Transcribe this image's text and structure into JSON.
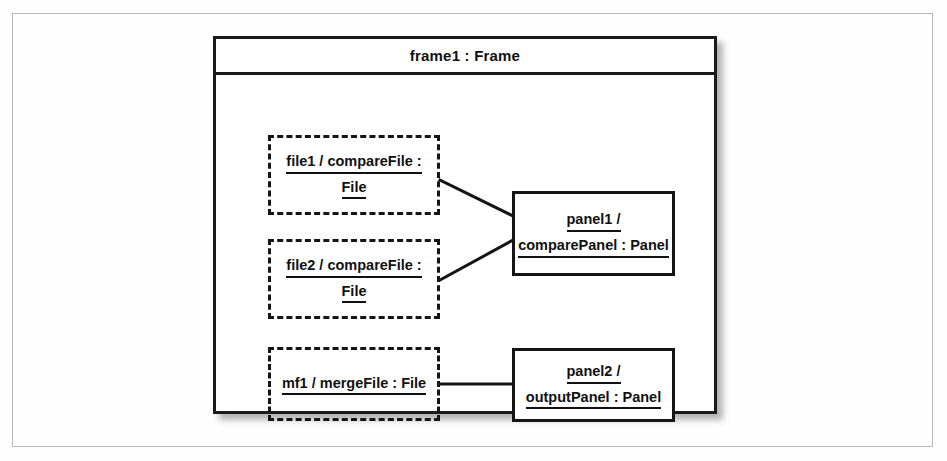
{
  "diagram": {
    "type": "uml-composite-structure",
    "frame": {
      "title": "frame1 : Frame",
      "title_underlined": false
    },
    "parts": [
      {
        "id": "file1",
        "kind": "dashed-part-box",
        "lines": [
          "file1 / compareFile :",
          "File"
        ],
        "underlined": [
          true,
          true
        ]
      },
      {
        "id": "file2",
        "kind": "dashed-part-box",
        "lines": [
          "file2 / compareFile :",
          "File"
        ],
        "underlined": [
          true,
          true
        ]
      },
      {
        "id": "mf1",
        "kind": "dashed-part-box",
        "lines": [
          "mf1 / mergeFile : File"
        ],
        "underlined": [
          true
        ]
      }
    ],
    "objects": [
      {
        "id": "panel1",
        "kind": "solid-object-box",
        "lines": [
          "panel1 /",
          "comparePanel : Panel"
        ],
        "underlined": [
          true,
          true
        ]
      },
      {
        "id": "panel2",
        "kind": "solid-object-box",
        "lines": [
          "panel2 /",
          "outputPanel : Panel"
        ],
        "underlined": [
          true,
          true
        ]
      }
    ],
    "connectors": [
      {
        "from": "file1",
        "to": "panel1",
        "style": "solid-diagonal"
      },
      {
        "from": "file2",
        "to": "panel1",
        "style": "solid-diagonal"
      },
      {
        "from": "mf1",
        "to": "panel2",
        "style": "solid-horizontal"
      }
    ],
    "colors": {
      "stroke": "#151515",
      "frame_stroke": "#1a1a1a",
      "background": "#ffffff",
      "page_border": "#b9b9b9"
    }
  }
}
